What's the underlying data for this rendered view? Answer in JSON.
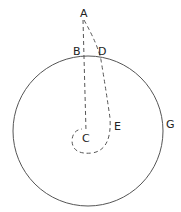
{
  "diagram": {
    "labels": {
      "A": "A",
      "B": "B",
      "C": "C",
      "D": "D",
      "E": "E",
      "G": "G"
    },
    "colors": {
      "stroke": "#555555",
      "text": "#222222"
    }
  }
}
